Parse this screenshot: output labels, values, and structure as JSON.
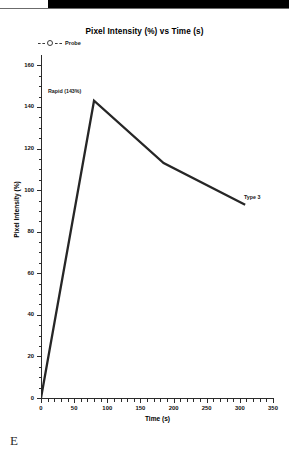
{
  "figure": {
    "panel_letter": "E",
    "title": "Pixel Intensity (%) vs Time (s)",
    "line_color": "#262626",
    "axis_color": "#2b2b2b",
    "background": "#ffffff"
  },
  "legend": {
    "position": "top-left",
    "entries": [
      {
        "label": "Probe",
        "marker": "open-circle",
        "line_style": "dashed",
        "color": "#3a3a3a"
      }
    ]
  },
  "annotations": [
    {
      "name": "peak-annotation",
      "text": "Rapid (143%)",
      "x": 80,
      "y": 143
    },
    {
      "name": "endpoint-annotation",
      "text": "Type 3",
      "x": 308,
      "y": 93
    }
  ],
  "chart_data": {
    "type": "line",
    "title": "Pixel Intensity (%) vs Time (s)",
    "xlabel": "Time (s)",
    "ylabel": "Pixel Intensity (%)",
    "xlim": [
      0,
      350
    ],
    "ylim": [
      0,
      165
    ],
    "xticks": [
      0,
      50,
      100,
      150,
      200,
      250,
      300,
      350
    ],
    "yticks": [
      0,
      20,
      40,
      60,
      80,
      100,
      120,
      140,
      160
    ],
    "xtick_labels": [
      "0",
      "50",
      "100",
      "150",
      "200",
      "250",
      "300",
      "350"
    ],
    "ytick_labels": [
      "0",
      "20",
      "40",
      "60",
      "80",
      "100",
      "120",
      "140",
      "160"
    ],
    "minor_ticks": true,
    "grid": false,
    "legend_position": "upper-left",
    "series": [
      {
        "name": "Probe",
        "color": "#262626",
        "x": [
          0,
          80,
          185,
          308
        ],
        "y": [
          0,
          143,
          113,
          93
        ],
        "points": [
          {
            "x": 0,
            "y": 0
          },
          {
            "x": 80,
            "y": 143
          },
          {
            "x": 185,
            "y": 113
          },
          {
            "x": 308,
            "y": 93
          }
        ]
      }
    ]
  }
}
